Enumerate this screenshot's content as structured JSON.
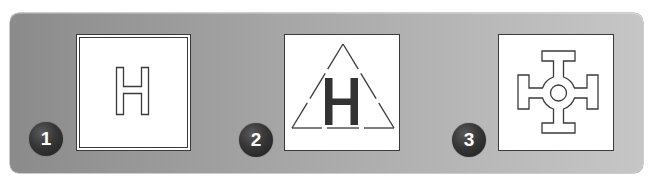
{
  "figure": {
    "background_gradient": [
      "#8b8b8b",
      "#c6c6c6"
    ],
    "stroke_color": "#3a3a3a",
    "badge_color": "#333333",
    "items": [
      {
        "number": "1",
        "symbol": "outlined-letter",
        "letter": "H",
        "frame": "double-square"
      },
      {
        "number": "2",
        "symbol": "solid-letter-in-dashed-triangle",
        "letter": "H",
        "frame": "single-square"
      },
      {
        "number": "3",
        "symbol": "cross-with-center-circle",
        "letter": "",
        "frame": "single-square"
      }
    ]
  }
}
